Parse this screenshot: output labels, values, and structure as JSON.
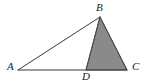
{
  "figure": {
    "kind": "geometry-diagram",
    "background_color": "#ffffff",
    "stroke_color": "#3a3a3a",
    "shade_color": "#8a8a8a",
    "shade_stroke_color": "#4a4a4a",
    "stroke_width": 1,
    "viewbox": "0 0 151 84",
    "points": {
      "A": {
        "label": "A",
        "x": 18,
        "y": 70
      },
      "B": {
        "label": "B",
        "x": 100,
        "y": 17
      },
      "C": {
        "label": "C",
        "x": 127,
        "y": 70
      },
      "D": {
        "label": "D",
        "x": 86,
        "y": 70
      }
    },
    "segments": [
      {
        "name": "AB",
        "from": "A",
        "to": "B"
      },
      {
        "name": "AC",
        "from": "A",
        "to": "C"
      },
      {
        "name": "BD",
        "from": "B",
        "to": "D"
      },
      {
        "name": "BC",
        "from": "B",
        "to": "C"
      }
    ],
    "shaded_region": {
      "name": "triangle-BDC",
      "vertices": [
        "B",
        "D",
        "C"
      ],
      "polygon_points": "100,17 86,70 127,70"
    },
    "outline_region": {
      "name": "triangle-ABC",
      "vertices": [
        "A",
        "B",
        "C"
      ],
      "polygon_points": "18,70 100,17 127,70"
    }
  }
}
